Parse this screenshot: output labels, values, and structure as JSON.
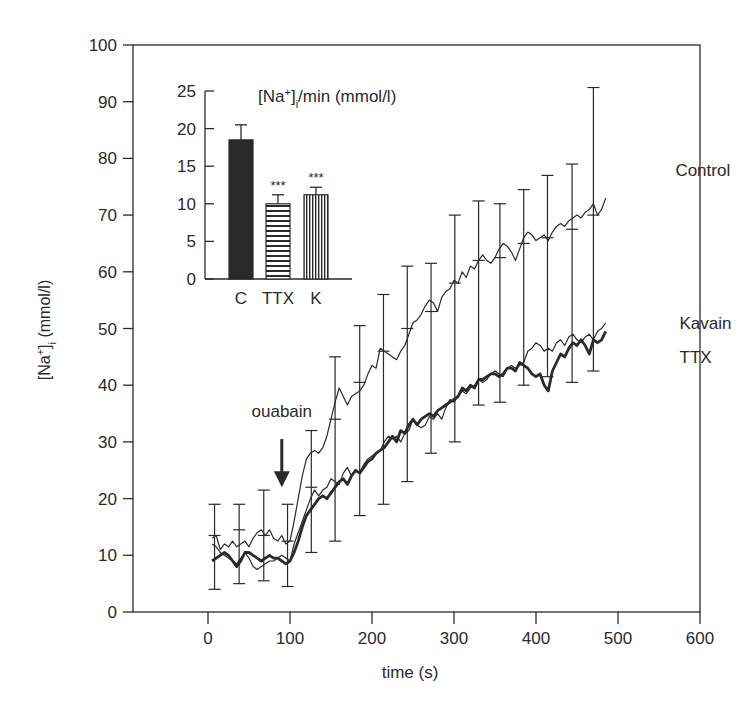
{
  "chart_data": [
    {
      "id": "main",
      "type": "line",
      "title": "",
      "xlabel": "time (s)",
      "ylabel": "[Na+]i (mmol/l)",
      "ylabel_parts": {
        "pre": "[Na",
        "sup": "+",
        "mid": "]",
        "sub": "i",
        "post": " (mmol/l)"
      },
      "xlim": [
        -90,
        600
      ],
      "ylim": [
        0,
        100
      ],
      "xticks": [
        0,
        100,
        200,
        300,
        400,
        500,
        600
      ],
      "yticks": [
        0,
        10,
        20,
        30,
        40,
        50,
        60,
        70,
        80,
        90,
        100
      ],
      "grid": false,
      "legend": {
        "position": "inline-right",
        "entries": [
          "Control",
          "Kavain",
          "TTX"
        ]
      },
      "annotations": [
        {
          "text": "ouabain",
          "x": 90,
          "y": 35.5,
          "arrow_from_y": 30.5,
          "arrow_to_y": 22
        }
      ],
      "series": [
        {
          "name": "Control",
          "label_pos": [
            570,
            78
          ],
          "line_width": 1.2,
          "x": [
            5,
            10,
            15,
            20,
            25,
            30,
            35,
            40,
            45,
            50,
            55,
            60,
            65,
            70,
            75,
            80,
            85,
            90,
            95,
            100,
            105,
            110,
            115,
            120,
            125,
            130,
            135,
            140,
            145,
            150,
            155,
            160,
            165,
            170,
            175,
            180,
            185,
            190,
            195,
            200,
            205,
            210,
            215,
            220,
            225,
            230,
            235,
            240,
            245,
            250,
            255,
            260,
            265,
            270,
            275,
            280,
            285,
            290,
            295,
            300,
            305,
            310,
            315,
            320,
            325,
            330,
            335,
            340,
            345,
            350,
            355,
            360,
            365,
            370,
            375,
            380,
            385,
            390,
            395,
            400,
            405,
            410,
            415,
            420,
            425,
            430,
            435,
            440,
            445,
            450,
            455,
            460,
            465,
            470,
            475,
            480,
            485
          ],
          "y": [
            13,
            13.5,
            11,
            12,
            11.5,
            12.5,
            11.5,
            12,
            12.5,
            11.5,
            13,
            14,
            14.5,
            13.5,
            14.5,
            13,
            12.5,
            13.5,
            12,
            12.5,
            16,
            20,
            24,
            27,
            28,
            28.5,
            28,
            29,
            31,
            34,
            37,
            39.5,
            38,
            36.5,
            38,
            38.5,
            39,
            40,
            42,
            43.5,
            43,
            46.5,
            46,
            45.5,
            45,
            44.5,
            46,
            47,
            49,
            51,
            51.5,
            52.5,
            54,
            55,
            54.5,
            53,
            55.5,
            56.5,
            57,
            58.5,
            58,
            60,
            59,
            61,
            60.5,
            62,
            63,
            62,
            61.5,
            62.5,
            64,
            65,
            64.5,
            63.5,
            62,
            64,
            66,
            67,
            66.5,
            65.5,
            66,
            66.5,
            65.5,
            67,
            68,
            68.5,
            68,
            69,
            69.5,
            70,
            69.5,
            70.5,
            71,
            72,
            70,
            71,
            73
          ]
        },
        {
          "name": "Kavain",
          "label_pos": [
            575,
            51
          ],
          "line_width": 1.2,
          "x": [
            5,
            10,
            15,
            20,
            25,
            30,
            35,
            40,
            45,
            50,
            55,
            60,
            65,
            70,
            75,
            80,
            85,
            90,
            95,
            100,
            105,
            110,
            115,
            120,
            125,
            130,
            135,
            140,
            145,
            150,
            155,
            160,
            165,
            170,
            175,
            180,
            185,
            190,
            195,
            200,
            205,
            210,
            215,
            220,
            225,
            230,
            235,
            240,
            245,
            250,
            255,
            260,
            265,
            270,
            275,
            280,
            285,
            290,
            295,
            300,
            305,
            310,
            315,
            320,
            325,
            330,
            335,
            340,
            345,
            350,
            355,
            360,
            365,
            370,
            375,
            380,
            385,
            390,
            395,
            400,
            405,
            410,
            415,
            420,
            425,
            430,
            435,
            440,
            445,
            450,
            455,
            460,
            465,
            470,
            475,
            480,
            485
          ],
          "y": [
            12,
            11.5,
            10.5,
            10,
            9.5,
            9,
            8.5,
            9.5,
            10.5,
            9.5,
            8,
            7.5,
            8,
            8.5,
            9,
            9,
            9.5,
            10,
            9.5,
            9,
            12,
            14,
            16,
            18,
            20,
            21.5,
            20.5,
            21.5,
            22,
            23.5,
            23,
            22.5,
            24.5,
            25.5,
            24,
            25,
            24.5,
            26,
            27,
            27.5,
            28,
            28.5,
            30,
            31,
            30.5,
            31,
            30,
            31.5,
            32,
            34,
            33,
            32.5,
            33,
            34.5,
            34,
            35,
            34,
            36,
            37.5,
            37,
            38,
            39,
            38.5,
            39.5,
            40,
            41,
            40.5,
            41,
            42,
            42.5,
            42,
            41.5,
            43,
            43.5,
            43,
            43.5,
            44,
            46,
            46.5,
            47.5,
            47,
            46,
            46.5,
            46,
            47.5,
            48,
            47,
            48.5,
            49,
            48,
            47.5,
            48.5,
            49,
            48,
            49.5,
            50,
            51
          ]
        },
        {
          "name": "TTX",
          "label_pos": [
            575,
            45
          ],
          "line_width": 2.8,
          "x": [
            5,
            10,
            15,
            20,
            25,
            30,
            35,
            40,
            45,
            50,
            55,
            60,
            65,
            70,
            75,
            80,
            85,
            90,
            95,
            100,
            105,
            110,
            115,
            120,
            125,
            130,
            135,
            140,
            145,
            150,
            155,
            160,
            165,
            170,
            175,
            180,
            185,
            190,
            195,
            200,
            205,
            210,
            215,
            220,
            225,
            230,
            235,
            240,
            245,
            250,
            255,
            260,
            265,
            270,
            275,
            280,
            285,
            290,
            295,
            300,
            305,
            310,
            315,
            320,
            325,
            330,
            335,
            340,
            345,
            350,
            355,
            360,
            365,
            370,
            375,
            380,
            385,
            390,
            395,
            400,
            405,
            410,
            415,
            420,
            425,
            430,
            435,
            440,
            445,
            450,
            455,
            460,
            465,
            470,
            475,
            480,
            485
          ],
          "y": [
            9,
            9.5,
            10,
            10.5,
            10,
            9,
            8,
            9,
            10.5,
            10.5,
            10,
            9.5,
            9,
            9.5,
            10,
            9.5,
            9.5,
            9,
            8.5,
            9,
            10.5,
            12.5,
            15,
            17,
            18,
            19,
            20,
            20.5,
            20,
            21,
            22,
            23,
            23.5,
            22.5,
            24,
            25,
            24.5,
            25.5,
            26.5,
            27,
            28,
            28.5,
            29,
            30,
            31,
            30,
            32,
            31.5,
            33,
            34,
            33,
            34,
            34.5,
            35,
            34.5,
            35.5,
            36,
            36.5,
            37,
            37.5,
            38,
            39.5,
            39,
            40,
            39.5,
            41,
            41,
            41.5,
            42,
            42,
            41.5,
            42,
            43,
            43,
            42.5,
            44,
            43.5,
            43,
            42,
            41.5,
            42,
            40,
            39,
            42.5,
            44,
            45.5,
            45,
            46.5,
            47.5,
            47,
            48,
            47,
            45.5,
            48,
            47.5,
            48,
            49.5
          ]
        }
      ],
      "error_bars": [
        {
          "x": 8,
          "y": 13.5,
          "lo": 4,
          "hi": 19
        },
        {
          "x": 38,
          "y": 14.5,
          "lo": 5,
          "hi": 19
        },
        {
          "x": 68,
          "y": 13.5,
          "lo": 5.5,
          "hi": 21.5
        },
        {
          "x": 97,
          "y": 12.5,
          "lo": 4.5,
          "hi": 19
        },
        {
          "x": 126,
          "y": 22,
          "lo": 10.5,
          "hi": 32
        },
        {
          "x": 155,
          "y": 34,
          "lo": 12.5,
          "hi": 45
        },
        {
          "x": 185,
          "y": 40.5,
          "lo": 17,
          "hi": 50.5
        },
        {
          "x": 214,
          "y": 46,
          "lo": 19,
          "hi": 56
        },
        {
          "x": 243,
          "y": 50,
          "lo": 23,
          "hi": 61
        },
        {
          "x": 272,
          "y": 53,
          "lo": 28,
          "hi": 61.5
        },
        {
          "x": 301,
          "y": 58,
          "lo": 30,
          "hi": 70
        },
        {
          "x": 330,
          "y": 62,
          "lo": 36.5,
          "hi": 72.5
        },
        {
          "x": 356,
          "y": 62.5,
          "lo": 37,
          "hi": 72
        },
        {
          "x": 385,
          "y": 65,
          "lo": 40,
          "hi": 74.5
        },
        {
          "x": 414,
          "y": 66,
          "lo": 41.5,
          "hi": 77
        },
        {
          "x": 444,
          "y": 67.5,
          "lo": 40.5,
          "hi": 79
        },
        {
          "x": 470,
          "y": 70,
          "lo": 42.5,
          "hi": 92.5
        }
      ],
      "ttx_error_bars": [
        {
          "x": 155,
          "y": 22.5,
          "hi": 26.5
        },
        {
          "x": 185,
          "y": 25,
          "lo": 16.5
        },
        {
          "x": 214,
          "y": 30,
          "hi": 33
        },
        {
          "x": 243,
          "y": 31.5,
          "lo": 17.5
        },
        {
          "x": 272,
          "y": 34,
          "hi": 42.5
        },
        {
          "x": 301,
          "y": 37,
          "lo": 24
        },
        {
          "x": 330,
          "y": 40,
          "hi": 44.5
        },
        {
          "x": 356,
          "y": 40,
          "lo": 36.5
        },
        {
          "x": 385,
          "y": 43,
          "hi": 52
        },
        {
          "x": 414,
          "y": 45.5,
          "lo": 40
        },
        {
          "x": 444,
          "y": 47,
          "hi": 56
        },
        {
          "x": 470,
          "y": 48,
          "hi": 59
        }
      ]
    },
    {
      "id": "inset",
      "type": "bar",
      "title": "[Na+]i/min (mmol/l)",
      "title_parts": {
        "pre": "[Na",
        "sup": "+",
        "mid": "]",
        "sub": "i",
        "post": "/min (mmol/l)"
      },
      "xlabel": "",
      "ylabel": "",
      "ylim": [
        0,
        25
      ],
      "yticks": [
        0,
        5,
        10,
        15,
        20,
        25
      ],
      "categories": [
        "C",
        "TTX",
        "K"
      ],
      "values": [
        18.5,
        10,
        11.2
      ],
      "errors": [
        2,
        1.2,
        1
      ],
      "significance": [
        "",
        "***",
        "***"
      ],
      "fills": [
        "solid",
        "horizontal-stripes",
        "vertical-stripes"
      ],
      "grid": false
    }
  ],
  "colors": {
    "ink": "#2a2a2a",
    "background": "#ffffff"
  }
}
